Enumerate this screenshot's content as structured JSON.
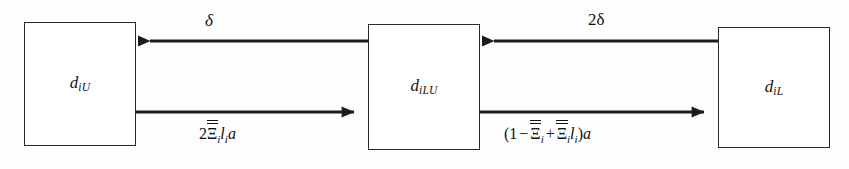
{
  "figure": {
    "type": "flow-diagram",
    "background_color": "#fefefe",
    "stroke_color": "#2a2a2a"
  },
  "nodes": [
    {
      "id": "diU",
      "base": "d",
      "subscript": "iU",
      "x": 24,
      "y": 22,
      "width": 112,
      "height": 124
    },
    {
      "id": "diLU",
      "base": "d",
      "subscript": "iLU",
      "x": 368,
      "y": 24,
      "width": 112,
      "height": 126
    },
    {
      "id": "diL",
      "base": "d",
      "subscript": "iL",
      "x": 718,
      "y": 27,
      "width": 112,
      "height": 121
    }
  ],
  "edges": [
    {
      "id": "diLU-to-diU",
      "from": "diLU",
      "to": "diU",
      "direction": "leftward",
      "row": "top",
      "label": "δ",
      "label_plain": "delta"
    },
    {
      "id": "diL-to-diLU",
      "from": "diL",
      "to": "diLU",
      "direction": "leftward",
      "row": "top",
      "label": "2δ",
      "label_plain": "2 delta"
    },
    {
      "id": "diU-to-diLU",
      "from": "diU",
      "to": "diLU",
      "direction": "rightward",
      "row": "bottom",
      "label": "2Ξ̅̅ᵢ lᵢ a",
      "label_plain": "2 Xi-double-bar_i l_i a"
    },
    {
      "id": "diLU-to-diL",
      "from": "diLU",
      "to": "diL",
      "direction": "rightward",
      "row": "bottom",
      "label": "(1 − Ξ̅̅ᵢ + Ξ̅̅ᵢ lᵢ)a",
      "label_plain": "(1 - Xi-double-bar_i + Xi-double-bar_i l_i) a"
    }
  ],
  "labels": {
    "delta_top_left": "δ",
    "delta_top_right": "2δ",
    "bottom_left_prefix": "2",
    "bottom_left_xi": "Ξ",
    "bottom_left_sub_i": "i",
    "bottom_left_l": "l",
    "bottom_left_l_sub": "i",
    "bottom_left_a": "a",
    "bottom_right_open": "(1",
    "bottom_right_minus": "−",
    "bottom_right_xi1": "Ξ",
    "bottom_right_sub1": "i",
    "bottom_right_plus": "+",
    "bottom_right_xi2": "Ξ",
    "bottom_right_sub2": "i",
    "bottom_right_l": "l",
    "bottom_right_l_sub": "i",
    "bottom_right_close": ")",
    "bottom_right_a": "a"
  }
}
